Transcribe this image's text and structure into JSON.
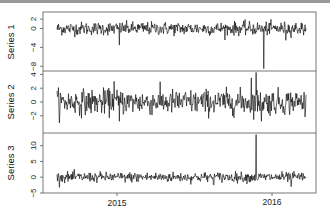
{
  "chart_data": {
    "type": "line",
    "layout": "stacked-panels",
    "title": "",
    "xlabel": "",
    "x_ticks": [
      "2015",
      "2016"
    ],
    "grid": false,
    "legend": "none",
    "line_color": "#000000",
    "panels": [
      {
        "name": "Series 1",
        "ylabel": "Series 1",
        "y_ticks": [
          2,
          0,
          -4,
          -8
        ],
        "ylim": [
          -9,
          3.5
        ],
        "baseline": 0,
        "noise_sd": 0.7,
        "notable_spikes": [
          {
            "x_frac": 0.25,
            "value": -3.5
          },
          {
            "x_frac": 0.83,
            "value": -8.5
          },
          {
            "x_frac": 0.92,
            "value": -2.5
          }
        ]
      },
      {
        "name": "Series 2",
        "ylabel": "Series 2",
        "y_ticks": [
          4,
          2,
          0,
          -2
        ],
        "ylim": [
          -4.5,
          4.5
        ],
        "baseline": 0,
        "noise_sd": 0.9,
        "notable_spikes": [
          {
            "x_frac": 0.23,
            "value": 3.0
          },
          {
            "x_frac": 0.25,
            "value": -2.8
          },
          {
            "x_frac": 0.78,
            "value": 3.5
          },
          {
            "x_frac": 0.8,
            "value": 4.3
          },
          {
            "x_frac": 0.82,
            "value": -2.8
          }
        ]
      },
      {
        "name": "Series 3",
        "ylabel": "Series 3",
        "y_ticks": [
          10,
          5,
          0,
          -5
        ],
        "ylim": [
          -5,
          14
        ],
        "baseline": 0,
        "noise_sd": 0.8,
        "notable_spikes": [
          {
            "x_frac": 0.8,
            "value": 13.5
          },
          {
            "x_frac": 0.94,
            "value": -3.0
          },
          {
            "x_frac": 0.63,
            "value": -2.5
          }
        ]
      }
    ],
    "n_points": 520
  }
}
